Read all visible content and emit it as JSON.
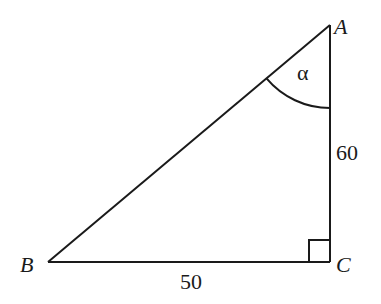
{
  "diagram": {
    "type": "right-triangle",
    "vertices": {
      "A": {
        "label": "A"
      },
      "B": {
        "label": "B"
      },
      "C": {
        "label": "C"
      }
    },
    "sides": {
      "AC": {
        "label": "60"
      },
      "BC": {
        "label": "50"
      }
    },
    "angle_at_A": {
      "label": "α"
    },
    "right_angle_at": "C",
    "colors": {
      "stroke": "#1a1a1a",
      "background": "#ffffff"
    }
  }
}
